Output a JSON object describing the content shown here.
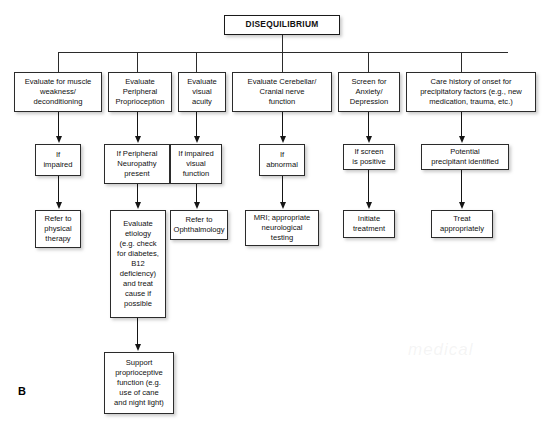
{
  "figure": {
    "panel_letter": "B",
    "watermark": "medical",
    "background_color": "#ffffff",
    "line_color": "#2b2b2b",
    "text_color": "#101010"
  },
  "title_node": {
    "label": "DISEQUILIBRIUM"
  },
  "columns": [
    {
      "id": "muscle-weakness",
      "assess": "Evaluate for muscle\nweakness/\ndeconditioning",
      "condition": "If\nimpaired",
      "action": "Refer to\nphysical\ntherapy"
    },
    {
      "id": "peripheral-proprioception",
      "assess": "Evaluate\nPeripheral\nProprioception",
      "condition": "If Peripheral\nNeuropathy\npresent",
      "action": "Evaluate\netiology\n(e.g. check\nfor diabetes,\nB12\ndeficiency)\nand treat\ncause if\npossible",
      "followup": "Support\nproprioceptive\nfunction (e.g.\nuse of cane\nand night light)"
    },
    {
      "id": "visual-acuity",
      "assess": "Evaluate\nvisual\nacuity",
      "condition": "If impaired\nvisual\nfunction",
      "action": "Refer to\nOphthalmology"
    },
    {
      "id": "cerebellar-cranial-nerve",
      "assess": "Evaluate Cerebellar/\nCranial nerve\nfunction",
      "condition": "If\nabnormal",
      "action": "MRI; appropriate\nneurological\ntesting"
    },
    {
      "id": "anxiety-depression",
      "assess": "Screen for\nAnxiety/\nDepression",
      "condition": "If screen\nis positive",
      "action": "Initiate\ntreatment"
    },
    {
      "id": "care-history",
      "assess": "Care history of onset for\nprecipitatory factors (e.g., new\nmedication, trauma, etc.)",
      "condition": "Potential\nprecipitant identified",
      "action": "Treat\nappropriately"
    }
  ]
}
